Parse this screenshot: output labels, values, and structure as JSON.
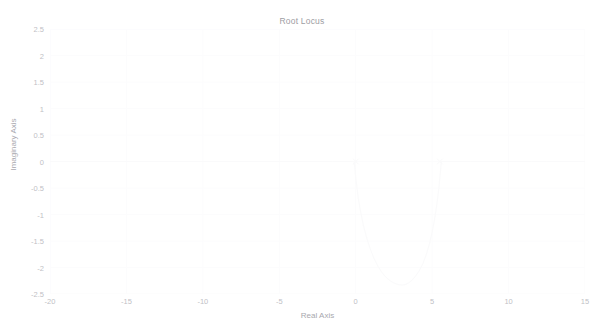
{
  "figure": {
    "title": "Root Locus",
    "background_color": "#ffffff",
    "axis_color": "#fdfdfe",
    "grid_color": "#fcfcfd",
    "locus_color": "#fafafb",
    "tick_text_color": "#bfbfc6",
    "label_text_color": "#a8a8ae",
    "title_text_color": "#9d9da3"
  },
  "axes": {
    "xlabel": "Real Axis",
    "ylabel": "Imaginary Axis",
    "xlim": [
      -20,
      15
    ],
    "ylim": [
      -2.5,
      2.5
    ],
    "xticks": [
      -20,
      -15,
      -10,
      -5,
      0,
      5,
      10,
      15
    ],
    "xtick_labels": [
      "-20",
      "-15",
      "-10",
      "-5",
      "0",
      "5",
      "10",
      "15"
    ],
    "yticks": [
      2.5,
      2,
      1.5,
      1,
      0.5,
      0,
      -0.5,
      -1,
      -1.5,
      -2,
      -2.5
    ],
    "ytick_labels": [
      "2.5",
      "2",
      "1.5",
      "1",
      "0.5",
      "0",
      "-0.5",
      "-1",
      "-1.5",
      "-2",
      "-2.5"
    ],
    "grid": true
  },
  "chart_data": {
    "type": "line",
    "title": "Root Locus",
    "xlabel": "Real Axis",
    "ylabel": "Imaginary Axis",
    "xlim": [
      -20,
      15
    ],
    "ylim": [
      -2.5,
      2.5
    ],
    "grid": true,
    "legend": null,
    "series": [
      {
        "name": "real-axis-locus-left",
        "comment": "locus segment lying on the real axis, left portion",
        "x": [
          -20,
          -17.5,
          -15,
          -12.5,
          -10,
          -7.5,
          -5,
          -3,
          -1.5,
          -0.2
        ],
        "y": [
          0,
          0,
          0,
          0,
          0,
          0,
          0,
          0,
          0,
          0
        ]
      },
      {
        "name": "real-axis-locus-right",
        "comment": "locus segment lying on the real axis, right portion",
        "x": [
          5.6,
          6.5,
          7.5,
          8.5,
          9.5,
          10.5,
          11.5,
          12.5,
          13.5,
          15
        ],
        "y": [
          0,
          0,
          0,
          0,
          0,
          0,
          0,
          0,
          0,
          0
        ]
      },
      {
        "name": "lower-branch-left",
        "comment": "branch leaving the real axis near s = 0 and curving down",
        "x": [
          -0.1,
          0.05,
          0.3,
          0.7,
          1.2,
          1.7,
          2.2,
          2.7,
          3.0
        ],
        "y": [
          0,
          -0.45,
          -0.95,
          -1.45,
          -1.85,
          -2.1,
          -2.25,
          -2.32,
          -2.33
        ]
      },
      {
        "name": "lower-branch-right",
        "comment": "branch leaving the real axis near s = 5.5 and curving down to join",
        "x": [
          5.6,
          5.45,
          5.2,
          4.85,
          4.4,
          3.9,
          3.45,
          3.15,
          3.0
        ],
        "y": [
          0,
          -0.5,
          -1.05,
          -1.55,
          -1.95,
          -2.18,
          -2.3,
          -2.33,
          -2.33
        ]
      }
    ],
    "markers": [
      {
        "name": "pole-marker",
        "symbol": "x",
        "x": 0.0,
        "y": 0.0
      },
      {
        "name": "breakaway-marker",
        "symbol": "x",
        "x": 5.5,
        "y": 0.0
      }
    ]
  }
}
